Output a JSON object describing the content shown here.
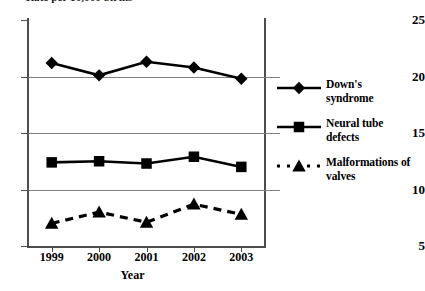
{
  "chart_data": {
    "type": "line",
    "title": "Rate per 10,000 births",
    "xlabel": "Year",
    "ylabel": "",
    "categories": [
      "1999",
      "2000",
      "2001",
      "2002",
      "2003"
    ],
    "x": [
      1999,
      2000,
      2001,
      2002,
      2003
    ],
    "ylim": [
      5,
      25
    ],
    "yticks": [
      25,
      20,
      15,
      10,
      5
    ],
    "grid": true,
    "legend_position": "right",
    "series": [
      {
        "name": "Down's syndrome",
        "label_lines": [
          "Down's",
          "syndrome"
        ],
        "marker": "diamond",
        "linestyle": "solid",
        "color": "#000000",
        "values": [
          21.2,
          20.1,
          21.3,
          20.8,
          19.8
        ]
      },
      {
        "name": "Neural tube defects",
        "label_lines": [
          "Neural tube",
          "defects"
        ],
        "marker": "square",
        "linestyle": "solid",
        "color": "#000000",
        "values": [
          12.4,
          12.5,
          12.3,
          12.9,
          12.0
        ]
      },
      {
        "name": "Malformations of valves",
        "label_lines": [
          "Malformations of",
          "valves"
        ],
        "marker": "triangle",
        "linestyle": "dashed",
        "color": "#000000",
        "values": [
          7.0,
          8.0,
          7.1,
          8.7,
          7.8
        ]
      }
    ]
  },
  "axes": {
    "y_tick_labels": [
      "25",
      "20",
      "15",
      "10",
      "5"
    ],
    "x_tick_labels": [
      "1999",
      "2000",
      "2001",
      "2002",
      "2003"
    ],
    "x_axis_title": "Year"
  },
  "legend": {
    "entries": [
      {
        "line1": "Down's",
        "line2": "syndrome"
      },
      {
        "line1": "Neural tube",
        "line2": "defects"
      },
      {
        "line1": "Malformations of",
        "line2": "valves"
      }
    ]
  }
}
